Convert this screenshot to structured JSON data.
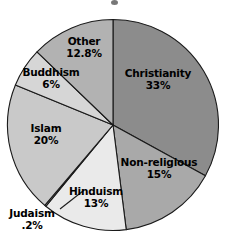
{
  "chart_data": {
    "type": "pie",
    "title": "",
    "xlabel": "",
    "ylabel": "",
    "legend_position": "none",
    "grid": false,
    "labels_inside": true,
    "start_angle_deg": 0,
    "direction": "clockwise",
    "categories": [
      "Christianity",
      "Non-religious",
      "Hinduism",
      "Judaism",
      "Islam",
      "Buddhism",
      "Other"
    ],
    "values": [
      33,
      15,
      13,
      0.2,
      20,
      6,
      12.8
    ],
    "value_labels": [
      "33%",
      "15%",
      "13%",
      ".2%",
      "20%",
      "6%",
      "12.8%"
    ],
    "colors": [
      "#8c8c8c",
      "#a9a9a9",
      "#eaeaea",
      "#fbfbfb",
      "#c9c9c9",
      "#d6d6d6",
      "#b2b2b2"
    ],
    "slice_border_color": "#1a1a1a",
    "background": "#ffffff",
    "slices": [
      {
        "name": "Christianity",
        "value": 33,
        "value_label": "33%",
        "color": "#8c8c8c"
      },
      {
        "name": "Non-religious",
        "value": 15,
        "value_label": "15%",
        "color": "#a9a9a9"
      },
      {
        "name": "Hinduism",
        "value": 13,
        "value_label": "13%",
        "color": "#eaeaea"
      },
      {
        "name": "Judaism",
        "value": 0.2,
        "value_label": ".2%",
        "color": "#fbfbfb"
      },
      {
        "name": "Islam",
        "value": 20,
        "value_label": "20%",
        "color": "#c9c9c9"
      },
      {
        "name": "Buddhism",
        "value": 6,
        "value_label": "6%",
        "color": "#d6d6d6"
      },
      {
        "name": "Other",
        "value": 12.8,
        "value_label": "12.8%",
        "color": "#b2b2b2"
      }
    ]
  },
  "labels": {
    "christianity": {
      "name": "Christianity",
      "value": "33%"
    },
    "nonreligious": {
      "name": "Non-religious",
      "value": "15%"
    },
    "hinduism": {
      "name": "Hinduism",
      "value": "13%"
    },
    "judaism": {
      "name": "Judaism",
      "value": ".2%"
    },
    "islam": {
      "name": "Islam",
      "value": "20%"
    },
    "buddhism": {
      "name": "Buddhism",
      "value": "6%"
    },
    "other": {
      "name": "Other",
      "value": "12.8%"
    }
  }
}
